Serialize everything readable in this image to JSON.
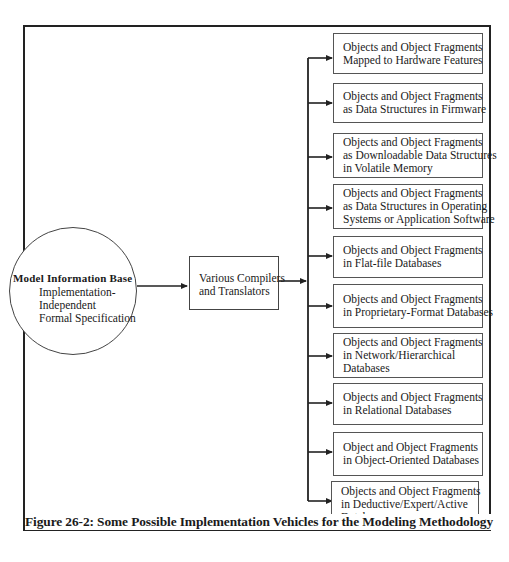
{
  "figure": {
    "caption": "Figure 26-2: Some Possible Implementation Vehicles for the Modeling Methodology"
  },
  "source": {
    "title": "Model Information Base",
    "lines": [
      "Implementation-",
      "Independent",
      "Formal Specification"
    ]
  },
  "process": {
    "lines": [
      "Various Compilers",
      "and Translators"
    ]
  },
  "targets": [
    {
      "lines": [
        "Objects and Object Fragments",
        "Mapped to Hardware Features"
      ]
    },
    {
      "lines": [
        "Objects and Object Fragments",
        "as Data Structures in Firmware"
      ]
    },
    {
      "lines": [
        "Objects and Object Fragments",
        "as Downloadable Data Structures",
        "in Volatile Memory"
      ]
    },
    {
      "lines": [
        "Objects and Object Fragments",
        "as Data Structures in Operating",
        "Systems or Application Software"
      ]
    },
    {
      "lines": [
        "Objects and Object Fragments",
        "in Flat-file Databases"
      ]
    },
    {
      "lines": [
        "Objects and Object Fragments",
        "in Proprietary-Format Databases"
      ]
    },
    {
      "lines": [
        "Objects and Object Fragments",
        "in Network/Hierarchical",
        "Databases"
      ]
    },
    {
      "lines": [
        "Objects and Object Fragments",
        "in Relational Databases"
      ]
    },
    {
      "lines": [
        "Object and Object Fragments",
        "in Object-Oriented Databases"
      ]
    },
    {
      "lines": [
        "Objects and Object Fragments",
        "in Deductive/Expert/Active",
        "Databases"
      ]
    }
  ]
}
